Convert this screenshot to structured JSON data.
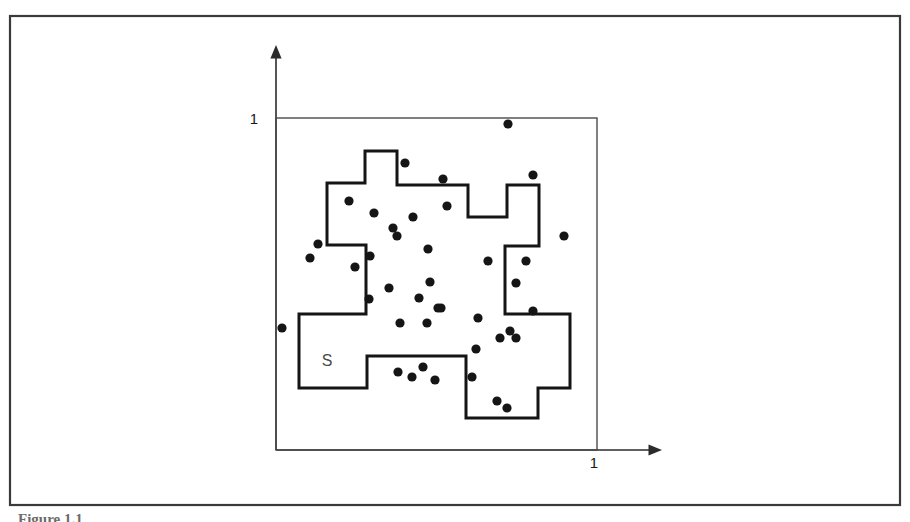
{
  "figure": {
    "frame": {
      "x": 10,
      "y": 16,
      "width": 890,
      "height": 489,
      "stroke": "#3a3a3a",
      "stroke_width": 2.2
    },
    "background": "#ffffff",
    "ink_color": "#1a1a1a",
    "caption_partial": "Figure 1.1"
  },
  "axes": {
    "x_axis": {
      "y": 450,
      "x_start": 276,
      "x_end": 662,
      "label": "1",
      "label_x": 594,
      "label_y": 468
    },
    "y_axis": {
      "x": 276,
      "y_start": 450,
      "y_end": 45,
      "label": "1",
      "label_x": 254,
      "label_y": 124
    },
    "stroke": "#2b2b2b",
    "stroke_width": 1.6,
    "arrow_size": 9
  },
  "unit_square": {
    "x": 276,
    "y": 118,
    "width": 321,
    "height": 332,
    "stroke": "#4a4a4a",
    "stroke_width": 1.4,
    "fill": "none"
  },
  "region": {
    "label": "S",
    "label_x": 327,
    "label_y": 366,
    "stroke": "#151515",
    "stroke_width": 3.0,
    "fill": "none",
    "outline_points": [
      [
        365,
        151
      ],
      [
        397,
        151
      ],
      [
        397,
        185
      ],
      [
        468,
        185
      ],
      [
        468,
        217
      ],
      [
        507,
        217
      ],
      [
        507,
        185
      ],
      [
        539,
        185
      ],
      [
        539,
        246
      ],
      [
        505,
        246
      ],
      [
        505,
        314
      ],
      [
        570,
        314
      ],
      [
        570,
        388
      ],
      [
        538,
        388
      ],
      [
        538,
        418
      ],
      [
        466,
        418
      ],
      [
        466,
        356
      ],
      [
        367,
        356
      ],
      [
        367,
        388
      ],
      [
        299,
        388
      ],
      [
        299,
        314
      ],
      [
        366,
        314
      ],
      [
        366,
        245
      ],
      [
        327,
        245
      ],
      [
        327,
        183
      ],
      [
        365,
        183
      ]
    ]
  },
  "chart_data": {
    "type": "scatter",
    "title": "",
    "xlabel": "",
    "ylabel": "",
    "xlim": [
      0,
      1
    ],
    "ylim": [
      0,
      1
    ],
    "xticks": [
      "1"
    ],
    "yticks": [
      "1"
    ],
    "grid": false,
    "legend": null,
    "annotations": [
      {
        "text": "S",
        "x": 0.159,
        "y": 0.253,
        "note": "label of the shaded region S"
      },
      {
        "text": "1",
        "x": 0.99,
        "y": -0.054,
        "note": "x-axis unit tick"
      },
      {
        "text": "1",
        "x": -0.068,
        "y": 0.982,
        "note": "y-axis unit tick"
      }
    ],
    "marker": {
      "shape": "circle",
      "radius_px": 4.6,
      "color": "#151515"
    },
    "n_points": 41,
    "points_px": [
      [
        508,
        124
      ],
      [
        405,
        163
      ],
      [
        533,
        175
      ],
      [
        443,
        179
      ],
      [
        349,
        201
      ],
      [
        447,
        206
      ],
      [
        374,
        213
      ],
      [
        413,
        217
      ],
      [
        393,
        228
      ],
      [
        397,
        236
      ],
      [
        564,
        236
      ],
      [
        318,
        244
      ],
      [
        428,
        249
      ],
      [
        370,
        256
      ],
      [
        355,
        267
      ],
      [
        488,
        261
      ],
      [
        526,
        261
      ],
      [
        516,
        283
      ],
      [
        430,
        282
      ],
      [
        389,
        288
      ],
      [
        441,
        308
      ],
      [
        369,
        299
      ],
      [
        419,
        298
      ],
      [
        438,
        308
      ],
      [
        533,
        311
      ],
      [
        478,
        318
      ],
      [
        400,
        323
      ],
      [
        427,
        323
      ],
      [
        282,
        328
      ],
      [
        510,
        331
      ],
      [
        500,
        338
      ],
      [
        516,
        338
      ],
      [
        476,
        349
      ],
      [
        423,
        367
      ],
      [
        398,
        372
      ],
      [
        472,
        377
      ],
      [
        412,
        377
      ],
      [
        435,
        380
      ],
      [
        497,
        401
      ],
      [
        507,
        408
      ],
      [
        310,
        258
      ]
    ],
    "points_unit": [
      [
        0.723,
        0.982
      ],
      [
        0.402,
        0.864
      ],
      [
        0.801,
        0.828
      ],
      [
        0.52,
        0.816
      ],
      [
        0.227,
        0.75
      ],
      [
        0.533,
        0.735
      ],
      [
        0.305,
        0.714
      ],
      [
        0.427,
        0.702
      ],
      [
        0.364,
        0.669
      ],
      [
        0.377,
        0.645
      ],
      [
        0.897,
        0.645
      ],
      [
        0.131,
        0.62
      ],
      [
        0.474,
        0.605
      ],
      [
        0.293,
        0.584
      ],
      [
        0.246,
        0.551
      ],
      [
        0.66,
        0.569
      ],
      [
        0.779,
        0.569
      ],
      [
        0.748,
        0.503
      ],
      [
        0.48,
        0.506
      ],
      [
        0.352,
        0.488
      ],
      [
        0.514,
        0.428
      ],
      [
        0.29,
        0.455
      ],
      [
        0.446,
        0.458
      ],
      [
        0.505,
        0.428
      ],
      [
        0.801,
        0.419
      ],
      [
        0.629,
        0.398
      ],
      [
        0.386,
        0.382
      ],
      [
        0.47,
        0.382
      ],
      [
        0.019,
        0.367
      ],
      [
        0.729,
        0.358
      ],
      [
        0.698,
        0.337
      ],
      [
        0.748,
        0.337
      ],
      [
        0.623,
        0.304
      ],
      [
        0.458,
        0.25
      ],
      [
        0.38,
        0.235
      ],
      [
        0.611,
        0.22
      ],
      [
        0.424,
        0.22
      ],
      [
        0.495,
        0.211
      ],
      [
        0.688,
        0.148
      ],
      [
        0.72,
        0.127
      ],
      [
        0.106,
        0.578
      ]
    ]
  }
}
